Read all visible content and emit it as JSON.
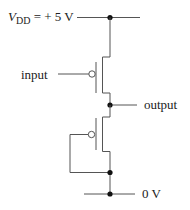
{
  "diagram": {
    "title": "",
    "type": "circuit",
    "labels": {
      "vdd_symbol": "V",
      "vdd_subscript": "DD",
      "vdd_value": " = + 5 V",
      "input": "input",
      "output": "output",
      "ground": "0 V"
    },
    "components": [
      {
        "id": "M1",
        "kind": "PMOS transistor",
        "gate": "input",
        "source": "VDD",
        "drain": "output"
      },
      {
        "id": "M2",
        "kind": "PMOS transistor",
        "gate": "0 V (tied to source/ground node)",
        "source": "0 V",
        "drain": "output"
      }
    ],
    "nodes": [
      {
        "id": "vdd",
        "label": "V_DD = +5 V"
      },
      {
        "id": "out",
        "label": "output"
      },
      {
        "id": "gnd_tap",
        "label": ""
      },
      {
        "id": "gnd",
        "label": "0 V"
      }
    ],
    "colors": {
      "wire": "#555555",
      "node": "#111111",
      "text": "#222222",
      "background": "#ffffff"
    }
  }
}
